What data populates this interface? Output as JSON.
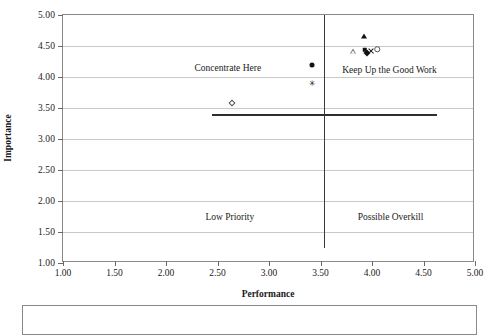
{
  "chart_data": {
    "type": "scatter",
    "title": "",
    "xlabel": "Performance",
    "ylabel": "Importance",
    "xlim": [
      1.0,
      5.0
    ],
    "ylim": [
      1.0,
      5.0
    ],
    "xticks": [
      "1.00",
      "1.50",
      "2.00",
      "2.50",
      "3.00",
      "3.50",
      "4.00",
      "4.50",
      "5.00"
    ],
    "yticks": [
      "1.00",
      "1.50",
      "2.00",
      "2.50",
      "3.00",
      "3.50",
      "4.00",
      "4.50",
      "5.00"
    ],
    "xtick_values": [
      1.0,
      1.5,
      2.0,
      2.5,
      3.0,
      3.5,
      4.0,
      4.5,
      5.0
    ],
    "ytick_values": [
      1.0,
      1.5,
      2.0,
      2.5,
      3.0,
      3.5,
      4.0,
      4.5,
      5.0
    ],
    "grid": "horizontal",
    "legend": "none",
    "crosshair": {
      "vertical_x": 3.53,
      "vertical_y_start": 1.25,
      "vertical_y_end": 5.0,
      "horizontal_y": 3.4,
      "horizontal_x_start": 2.45,
      "horizontal_x_end": 4.63
    },
    "quadrant_labels": [
      {
        "text": "Concentrate Here",
        "x": 2.6,
        "y": 4.14,
        "quadrant": "upper-left"
      },
      {
        "text": "Keep Up the Good Work",
        "x": 4.17,
        "y": 4.11,
        "quadrant": "upper-right"
      },
      {
        "text": "Low Priority",
        "x": 2.62,
        "y": 1.74,
        "quadrant": "lower-left"
      },
      {
        "text": "Possible Overkill",
        "x": 4.18,
        "y": 1.74,
        "quadrant": "lower-right"
      }
    ],
    "points": [
      {
        "marker": "open-diamond",
        "x": 2.64,
        "y": 3.58
      },
      {
        "marker": "filled-circle",
        "x": 3.42,
        "y": 4.19
      },
      {
        "marker": "star",
        "x": 3.42,
        "y": 3.89
      },
      {
        "marker": "open-triangle",
        "x": 3.82,
        "y": 4.42
      },
      {
        "marker": "filled-triangle",
        "x": 3.92,
        "y": 4.66
      },
      {
        "marker": "filled-square",
        "x": 3.93,
        "y": 4.44
      },
      {
        "marker": "filled-diamond",
        "x": 3.95,
        "y": 4.38
      },
      {
        "marker": "x-cross",
        "x": 3.99,
        "y": 4.42
      },
      {
        "marker": "open-circle",
        "x": 4.05,
        "y": 4.45
      }
    ]
  }
}
